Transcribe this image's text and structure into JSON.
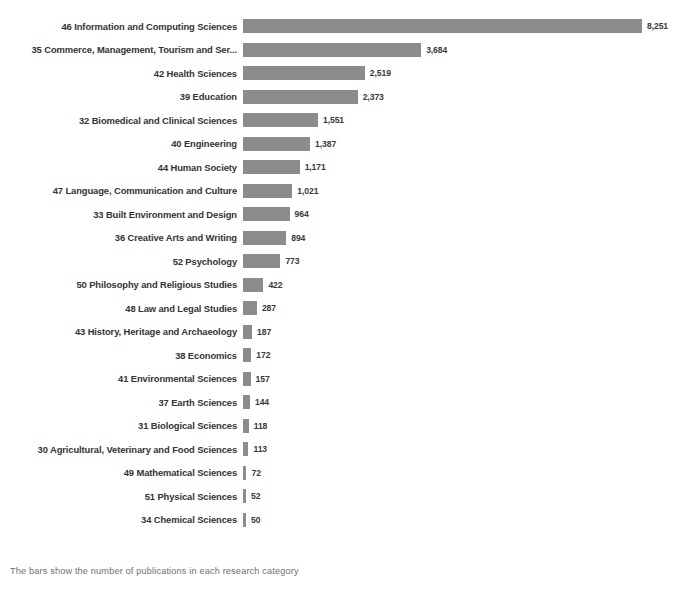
{
  "footnote": "The bars show the number of publications in each research category",
  "colors": {
    "bar": "#8c8c8c",
    "label": "#333333",
    "value": "#3a3a3a",
    "footnote": "#6f6f6f",
    "background": "#ffffff"
  },
  "chart_data": {
    "type": "bar",
    "orientation": "horizontal",
    "title": "",
    "subtitle": "",
    "xlabel": "",
    "ylabel": "",
    "grid": false,
    "legend": false,
    "xlim": [
      0,
      8251
    ],
    "categories": [
      "46 Information and Computing Sciences",
      "35 Commerce, Management, Tourism and Ser...",
      "42 Health Sciences",
      "39 Education",
      "32 Biomedical and Clinical Sciences",
      "40 Engineering",
      "44 Human Society",
      "47 Language, Communication and Culture",
      "33 Built Environment and Design",
      "36 Creative Arts and Writing",
      "52 Psychology",
      "50 Philosophy and Religious Studies",
      "48 Law and Legal Studies",
      "43 History, Heritage and Archaeology",
      "38 Economics",
      "41 Environmental Sciences",
      "37 Earth Sciences",
      "31 Biological Sciences",
      "30 Agricultural, Veterinary and Food Sciences",
      "49 Mathematical Sciences",
      "51 Physical Sciences",
      "34 Chemical Sciences"
    ],
    "values": [
      8251,
      3684,
      2519,
      2373,
      1551,
      1387,
      1171,
      1021,
      964,
      894,
      773,
      422,
      287,
      187,
      172,
      157,
      144,
      118,
      113,
      72,
      52,
      50
    ],
    "value_labels": [
      "8,251",
      "3,684",
      "2,519",
      "2,373",
      "1,551",
      "1,387",
      "1,171",
      "1,021",
      "964",
      "894",
      "773",
      "422",
      "287",
      "187",
      "172",
      "157",
      "144",
      "118",
      "113",
      "72",
      "52",
      "50"
    ]
  }
}
